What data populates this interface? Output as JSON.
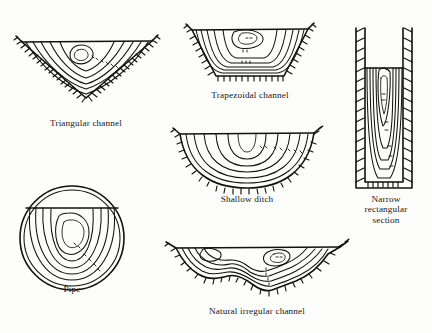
{
  "figure": {
    "background_color": "#fdfdfb",
    "ink_color": "#111111",
    "style": "line drawing, isovel contours with ground hatching"
  },
  "panels": [
    {
      "id": "triangular",
      "caption": "Triangular channel",
      "section_shape": "triangular",
      "contour_labels": [
        "2.0",
        "1.5",
        "1.0",
        "0.5"
      ]
    },
    {
      "id": "trapezoidal",
      "caption": "Trapezoidal channel",
      "section_shape": "trapezoidal",
      "contour_labels": [
        "2.0",
        "1.5",
        "1.0",
        "0.5"
      ]
    },
    {
      "id": "narrow-rectangular",
      "caption": "Narrow\nrectangular\nsection",
      "section_shape": "narrow rectangular",
      "contour_labels": [
        "2.5",
        "2.0",
        "1.5",
        "1.0"
      ]
    },
    {
      "id": "shallow-ditch",
      "caption": "Shallow ditch",
      "section_shape": "shallow semicircular ditch",
      "contour_labels": [
        "2.0",
        "1.5",
        "1.0",
        "0.5"
      ]
    },
    {
      "id": "pipe",
      "caption": "Pipe",
      "section_shape": "circular pipe, part full",
      "contour_labels": [
        "2.0",
        "1.5",
        "1.0",
        "0.5"
      ]
    },
    {
      "id": "natural-irregular",
      "caption": "Natural irregular channel",
      "section_shape": "natural irregular",
      "contour_labels": [
        "2.0",
        "1.5",
        "1.0",
        "0.5"
      ]
    }
  ]
}
